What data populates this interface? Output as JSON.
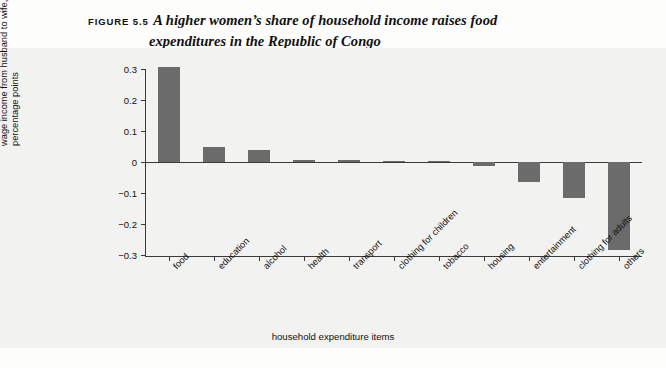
{
  "figure": {
    "tag": "FIGURE 5.5",
    "title_line1": "A higher women’s share of household income raises food",
    "title_line2": "expenditures in the Republic of Congo"
  },
  "colors": {
    "bar": "#6b6b6b",
    "axis": "#3a3a3a",
    "panel_background": "#f2f2f0",
    "page_background": "#fdfdfc",
    "text": "#111111"
  },
  "axis_titles": {
    "y_line1": "impact of a 10 percent redistribution of",
    "y_line2": "wage income from husband to wife,",
    "y_line3": "percentage points",
    "x": "household expenditure items"
  },
  "chart_data": {
    "type": "bar",
    "title": "A higher women’s share of household income raises food expenditures in the Republic of Congo",
    "xlabel": "household expenditure items",
    "ylabel": "impact of a 10 percent redistribution of wage income from husband to wife, percentage points",
    "categories": [
      "food",
      "education",
      "alcohol",
      "health",
      "transport",
      "clothing for children",
      "tobacco",
      "housing",
      "entertainment",
      "clothing for adults",
      "others"
    ],
    "values": [
      0.305,
      0.048,
      0.04,
      0.008,
      0.008,
      0.002,
      0.001,
      -0.013,
      -0.065,
      -0.115,
      -0.285
    ],
    "ylim": [
      -0.3,
      0.3
    ],
    "yticks": [
      0.3,
      0.2,
      0.1,
      0,
      -0.1,
      -0.2,
      -0.3
    ],
    "ytick_labels": [
      "0.3",
      "0.2",
      "0.1",
      "0",
      "−0.1",
      "−0.2",
      "−0.3"
    ],
    "grid": false,
    "legend": null
  }
}
